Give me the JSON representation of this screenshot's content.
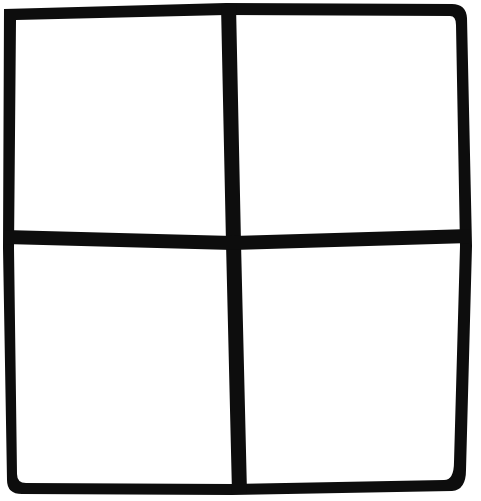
{
  "image": {
    "kind": "hand-drawn-line-figure",
    "title": "Hand-drawn square divided into four quadrants",
    "width": 481,
    "height": 501,
    "background_color": "#ffffff",
    "ink_color": "#0d0d0d",
    "medium": "thick black marker on white paper",
    "visible_text": ""
  },
  "figure": {
    "shape_name": "square-grid",
    "rows": 2,
    "columns": 2,
    "cell_count": 4,
    "stroke_count": 6,
    "outer_border_present": true,
    "labels_present": false
  },
  "outline": {
    "name": "outer-square",
    "description": "Slightly irregular hand-drawn square border",
    "corners": {
      "top_left": {
        "x": 8,
        "y": 8,
        "style": "sharp"
      },
      "top_right": {
        "x": 464,
        "y": 6,
        "style": "rounded"
      },
      "bottom_right": {
        "x": 466,
        "y": 490,
        "style": "sharp"
      },
      "bottom_left": {
        "x": 10,
        "y": 489,
        "style": "rounded"
      }
    },
    "stroke_width": 12,
    "path": "M 4,9 L 226,3 L 452,4 Q 466,4 467,18 L 472,246 L 466,470 Q 466,490 452,491 L 232,495 L 22,494 Q 7,494 7,480 L 3,248 Z",
    "inner_path": "M 16,20 L 226,15 L 450,16 Q 456,16 456,25 L 460,246 L 454,462 Q 454,480 444,480 L 232,484 L 26,483 Q 17,483 17,474 L 14,248 Z"
  },
  "dividers": [
    {
      "name": "vertical-divider",
      "orientation": "vertical",
      "description": "Central vertical stroke splitting the square into left and right halves; leans slightly right toward the bottom",
      "stroke_width": 15,
      "top_point": {
        "x": 228,
        "y": 6
      },
      "mid_point": {
        "x": 233,
        "y": 243
      },
      "bottom_point": {
        "x": 240,
        "y": 492
      },
      "path": "M 221,5 L 226,243 L 232,493 L 247,493 L 241,243 L 236,5 Z"
    },
    {
      "name": "horizontal-divider",
      "orientation": "horizontal",
      "description": "Central horizontal stroke splitting the square into top and bottom halves; sags slightly near the middle",
      "stroke_width": 14,
      "left_point": {
        "x": 6,
        "y": 237
      },
      "mid_point": {
        "x": 233,
        "y": 243
      },
      "right_point": {
        "x": 470,
        "y": 236
      },
      "path": "M 5,230 L 233,236 L 470,229 L 470,243 L 233,250 L 5,244 Z"
    }
  ],
  "quadrants": [
    {
      "name": "quadrant-top-left",
      "position": "top-left",
      "fill": "#ffffff",
      "bounds": {
        "x": 16,
        "y": 14,
        "width": 206,
        "height": 219
      },
      "content": ""
    },
    {
      "name": "quadrant-top-right",
      "position": "top-right",
      "fill": "#ffffff",
      "bounds": {
        "x": 238,
        "y": 14,
        "width": 222,
        "height": 219
      },
      "content": ""
    },
    {
      "name": "quadrant-bottom-left",
      "position": "bottom-left",
      "fill": "#ffffff",
      "bounds": {
        "x": 16,
        "y": 251,
        "width": 212,
        "height": 232
      },
      "content": ""
    },
    {
      "name": "quadrant-bottom-right",
      "position": "bottom-right",
      "fill": "#ffffff",
      "bounds": {
        "x": 244,
        "y": 251,
        "width": 216,
        "height": 232
      },
      "content": ""
    }
  ]
}
